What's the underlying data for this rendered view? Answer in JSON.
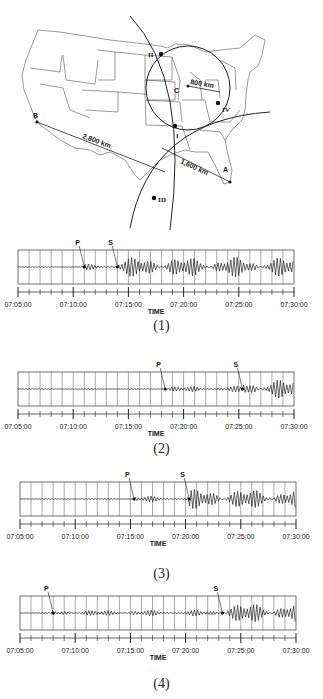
{
  "map": {
    "stations": [
      {
        "id": "A",
        "label": "A"
      },
      {
        "id": "B",
        "label": "B"
      },
      {
        "id": "C",
        "label": "C"
      }
    ],
    "intersections": [
      "I",
      "II",
      "III",
      "IV"
    ],
    "distances": {
      "B": "2,800 km",
      "A": "1,600 km",
      "C": "800 km"
    }
  },
  "seismograms": [
    {
      "caption": "(1)",
      "p_label": "P",
      "s_label": "S",
      "xlabel": "TIME"
    },
    {
      "caption": "(2)",
      "p_label": "P",
      "s_label": "S",
      "xlabel": "TIME"
    },
    {
      "caption": "(3)",
      "p_label": "P",
      "s_label": "S",
      "xlabel": "TIME"
    },
    {
      "caption": "(4)",
      "p_label": "P",
      "s_label": "S",
      "xlabel": "TIME"
    }
  ],
  "time_ticks": [
    "07:05:00",
    "07:10:00",
    "07:15:00",
    "07:20:00",
    "07:25:00",
    "07:30:00"
  ],
  "chart_data": [
    {
      "type": "line",
      "title": "Seismogram (1)",
      "xlabel": "TIME",
      "x_ticks": [
        "07:05:00",
        "07:10:00",
        "07:15:00",
        "07:20:00",
        "07:25:00",
        "07:30:00"
      ],
      "annotations": {
        "P": "07:11:00",
        "S": "07:14:00"
      }
    },
    {
      "type": "line",
      "title": "Seismogram (2)",
      "xlabel": "TIME",
      "x_ticks": [
        "07:05:00",
        "07:10:00",
        "07:15:00",
        "07:20:00",
        "07:25:00",
        "07:30:00"
      ],
      "annotations": {
        "P": "07:18:20",
        "S": "07:25:20"
      }
    },
    {
      "type": "line",
      "title": "Seismogram (3)",
      "xlabel": "TIME",
      "x_ticks": [
        "07:05:00",
        "07:10:00",
        "07:15:00",
        "07:20:00",
        "07:25:00",
        "07:30:00"
      ],
      "annotations": {
        "P": "07:15:20",
        "S": "07:20:20"
      }
    },
    {
      "type": "line",
      "title": "Seismogram (4)",
      "xlabel": "TIME",
      "x_ticks": [
        "07:05:00",
        "07:10:00",
        "07:15:00",
        "07:20:00",
        "07:25:00",
        "07:30:00"
      ],
      "annotations": {
        "P": "07:08:00",
        "S": "07:23:20"
      }
    }
  ]
}
